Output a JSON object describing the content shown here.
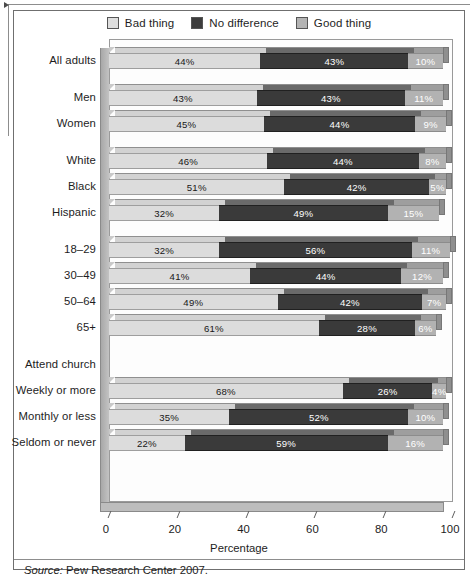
{
  "figure": {
    "source_prefix": "Source:",
    "source_text": "Pew Research Center 2007."
  },
  "chart_data": {
    "type": "bar",
    "orientation": "horizontal",
    "stacked": true,
    "style": "3d-stacked-horizontal-bar",
    "title": "",
    "xlabel": "Percentage",
    "ylabel": "",
    "xlim": [
      0,
      100
    ],
    "xticks": [
      0,
      20,
      40,
      60,
      80,
      100
    ],
    "xticklabels": [
      "0",
      "20",
      "40",
      "60",
      "80",
      "100"
    ],
    "grid": false,
    "legend_position": "top-center",
    "legend": [
      "Bad thing",
      "No difference",
      "Good thing"
    ],
    "series": [
      {
        "name": "Bad thing",
        "color": "#dcdcdc",
        "values": [
          44,
          43,
          45,
          46,
          51,
          32,
          32,
          41,
          49,
          61,
          null,
          68,
          35,
          22
        ]
      },
      {
        "name": "No difference",
        "color": "#3a3a3a",
        "values": [
          43,
          43,
          44,
          44,
          42,
          49,
          56,
          44,
          42,
          28,
          null,
          26,
          52,
          59
        ]
      },
      {
        "name": "Good thing",
        "color": "#b2b2b2",
        "values": [
          10,
          11,
          9,
          8,
          5,
          15,
          11,
          12,
          7,
          6,
          null,
          4,
          10,
          16
        ]
      }
    ],
    "categories": [
      "All adults",
      "Men",
      "Women",
      "White",
      "Black",
      "Hispanic",
      "18–29",
      "30–49",
      "50–64",
      "65+",
      "Attend church",
      "Weekly or more",
      "Monthly or less",
      "Seldom or never"
    ],
    "rows": [
      {
        "label": "All adults",
        "group": 0,
        "header": false,
        "bad": 44,
        "nodiff": 43,
        "good": 10,
        "bad_text": "44%",
        "nodiff_text": "43%",
        "good_text": "10%"
      },
      {
        "label": "Men",
        "group": 1,
        "header": false,
        "bad": 43,
        "nodiff": 43,
        "good": 11,
        "bad_text": "43%",
        "nodiff_text": "43%",
        "good_text": "11%"
      },
      {
        "label": "Women",
        "group": 1,
        "header": false,
        "bad": 45,
        "nodiff": 44,
        "good": 9,
        "bad_text": "45%",
        "nodiff_text": "44%",
        "good_text": "9%"
      },
      {
        "label": "White",
        "group": 2,
        "header": false,
        "bad": 46,
        "nodiff": 44,
        "good": 8,
        "bad_text": "46%",
        "nodiff_text": "44%",
        "good_text": "8%"
      },
      {
        "label": "Black",
        "group": 2,
        "header": false,
        "bad": 51,
        "nodiff": 42,
        "good": 5,
        "bad_text": "51%",
        "nodiff_text": "42%",
        "good_text": "5%"
      },
      {
        "label": "Hispanic",
        "group": 2,
        "header": false,
        "bad": 32,
        "nodiff": 49,
        "good": 15,
        "bad_text": "32%",
        "nodiff_text": "49%",
        "good_text": "15%"
      },
      {
        "label": "18–29",
        "group": 3,
        "header": false,
        "bad": 32,
        "nodiff": 56,
        "good": 11,
        "bad_text": "32%",
        "nodiff_text": "56%",
        "good_text": "11%"
      },
      {
        "label": "30–49",
        "group": 3,
        "header": false,
        "bad": 41,
        "nodiff": 44,
        "good": 12,
        "bad_text": "41%",
        "nodiff_text": "44%",
        "good_text": "12%"
      },
      {
        "label": "50–64",
        "group": 3,
        "header": false,
        "bad": 49,
        "nodiff": 42,
        "good": 7,
        "bad_text": "49%",
        "nodiff_text": "42%",
        "good_text": "7%"
      },
      {
        "label": "65+",
        "group": 3,
        "header": false,
        "bad": 61,
        "nodiff": 28,
        "good": 6,
        "bad_text": "61%",
        "nodiff_text": "28%",
        "good_text": "6%"
      },
      {
        "label": "Attend church",
        "group": 4,
        "header": true,
        "bad": null,
        "nodiff": null,
        "good": null,
        "bad_text": "",
        "nodiff_text": "",
        "good_text": ""
      },
      {
        "label": "Weekly or more",
        "group": 4,
        "header": false,
        "bad": 68,
        "nodiff": 26,
        "good": 4,
        "bad_text": "68%",
        "nodiff_text": "26%",
        "good_text": "4%"
      },
      {
        "label": "Monthly or less",
        "group": 4,
        "header": false,
        "bad": 35,
        "nodiff": 52,
        "good": 10,
        "bad_text": "35%",
        "nodiff_text": "52%",
        "good_text": "10%"
      },
      {
        "label": "Seldom or never",
        "group": 4,
        "header": false,
        "bad": 22,
        "nodiff": 59,
        "good": 16,
        "bad_text": "22%",
        "nodiff_text": "59%",
        "good_text": "16%"
      }
    ]
  }
}
